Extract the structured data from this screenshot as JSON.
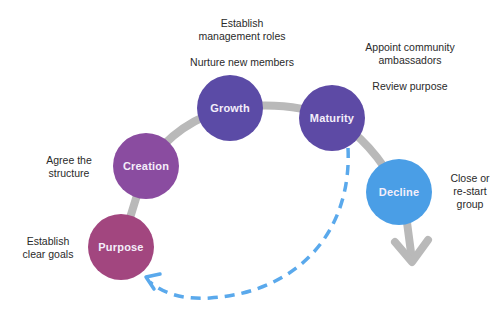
{
  "diagram": {
    "type": "lifecycle",
    "stages": [
      {
        "id": "purpose",
        "label": "Purpose",
        "color": "#a2467f",
        "cx": 121,
        "cy": 247,
        "r": 33
      },
      {
        "id": "creation",
        "label": "Creation",
        "color": "#8a4ca0",
        "cx": 146,
        "cy": 166,
        "r": 33
      },
      {
        "id": "growth",
        "label": "Growth",
        "color": "#5b4ba6",
        "cx": 230,
        "cy": 108,
        "r": 33
      },
      {
        "id": "maturity",
        "label": "Maturity",
        "color": "#5d4aa5",
        "cx": 332,
        "cy": 118,
        "r": 33
      },
      {
        "id": "decline",
        "label": "Decline",
        "color": "#4a9ee6",
        "cx": 399,
        "cy": 192,
        "r": 33
      }
    ],
    "notes": {
      "purpose": [
        "Establish",
        "clear goals"
      ],
      "creation": [
        "Agree the",
        "structure"
      ],
      "growth_top": [
        "Establish",
        "management roles"
      ],
      "growth": [
        "Nurture new members"
      ],
      "maturity_top": [
        "Appoint community",
        "ambassadors"
      ],
      "maturity": [
        "Review purpose"
      ],
      "decline": [
        "Close or",
        "re-start",
        "group"
      ]
    },
    "colors": {
      "connector": "#b9b9b9",
      "loop_arrow": "#5aa9ec",
      "text": "#2a2a2a",
      "node_text": "#f4eefa"
    },
    "connectors": {
      "main_path": "grey arc through Purpose, Creation, Growth, Maturity, Decline, ending in a downward arrow",
      "loop_back": "dashed blue arc from Maturity back to Purpose"
    }
  }
}
